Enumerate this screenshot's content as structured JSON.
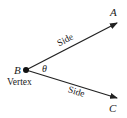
{
  "diagram": {
    "vertex": {
      "label": "B",
      "caption": "Vertex"
    },
    "angle_symbol": "θ",
    "rays": [
      {
        "end_label": "A",
        "side_label": "Side"
      },
      {
        "end_label": "C",
        "side_label": "Side"
      }
    ],
    "colors": {
      "stroke": "#222222",
      "background": "#ffffff"
    }
  }
}
